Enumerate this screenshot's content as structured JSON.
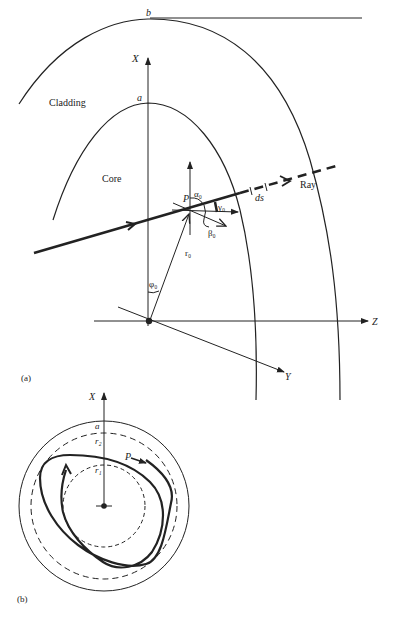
{
  "figure": {
    "panel_a": {
      "tag": "(a)",
      "labels": {
        "cladding_radius": "b",
        "core_radius": "a",
        "cladding": "Cladding",
        "core": "Core",
        "x_axis": "X",
        "y_axis": "Y",
        "z_axis": "Z",
        "point": "P",
        "alpha": "α₀",
        "beta": "β₀",
        "gamma": "γ₀",
        "r": "r₀",
        "phi": "φ₀",
        "ds": "ds",
        "ray": "Ray"
      }
    },
    "panel_b": {
      "tag": "(b)",
      "labels": {
        "x_axis": "X",
        "core_radius": "a",
        "outer_caustic": "r₂",
        "inner_caustic": "r₁",
        "point": "P"
      }
    },
    "colors": {
      "line": "#222222",
      "background": "#ffffff"
    }
  }
}
